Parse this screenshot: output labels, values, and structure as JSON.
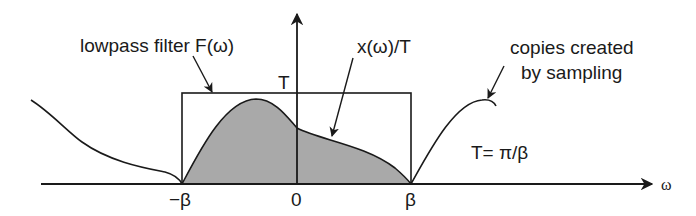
{
  "diagram": {
    "labels": {
      "filter": "lowpass filter F(ω)",
      "signal": "x(ω)/T",
      "copies_line1": "copies created",
      "copies_line2": "by sampling",
      "filter_height": "T",
      "relation": "T= π/β"
    },
    "x_axis": {
      "label": "ω",
      "ticks": [
        "−β",
        "0",
        "β"
      ]
    },
    "colors": {
      "stroke": "#1a1a1a",
      "fill": "#a9a9a9",
      "background": "#ffffff"
    }
  }
}
